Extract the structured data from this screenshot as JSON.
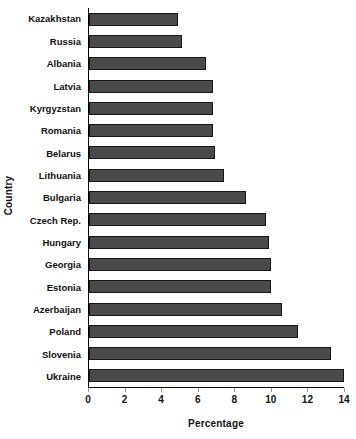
{
  "chart_data": {
    "type": "bar",
    "orientation": "horizontal",
    "title": "",
    "xlabel": "Percentage",
    "ylabel": "Country",
    "xlim": [
      0,
      14
    ],
    "xticks": [
      0,
      2,
      4,
      6,
      8,
      10,
      12,
      14
    ],
    "xtick_labels": [
      "0",
      "2",
      "4",
      "6",
      "8",
      "10",
      "12",
      "14"
    ],
    "grid": false,
    "legend": null,
    "bar_color": "#4a4a4a",
    "bar_border_color": "#161616",
    "categories": [
      "Kazakhstan",
      "Russia",
      "Albania",
      "Latvia",
      "Kyrgyzstan",
      "Romania",
      "Belarus",
      "Lithuania",
      "Bulgaria",
      "Czech Rep.",
      "Hungary",
      "Georgia",
      "Estonia",
      "Azerbaijan",
      "Poland",
      "Slovenia",
      "Ukraine"
    ],
    "values": [
      4.9,
      5.1,
      6.4,
      6.8,
      6.8,
      6.8,
      6.9,
      7.4,
      8.6,
      9.7,
      9.9,
      10.0,
      10.0,
      10.6,
      11.5,
      13.3,
      14.0
    ]
  }
}
